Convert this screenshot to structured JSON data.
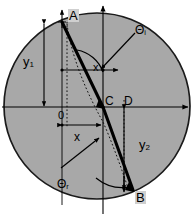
{
  "figure": {
    "type": "optics-ray-diagram",
    "background_color": "#ffffff",
    "disk_fill_color": "#a8a8a8",
    "disk_stroke_color": "#1a1a1a",
    "line_color": "#000000",
    "width": 194,
    "height": 216
  },
  "points": {
    "A": {
      "label": "A",
      "x": 62,
      "y": 22,
      "note": "entry point, top of ray"
    },
    "B": {
      "label": "B",
      "x": 133,
      "y": 190,
      "note": "exit point, bottom of ray"
    },
    "C": {
      "label": "C",
      "x": 103,
      "y": 107,
      "note": "center of circle / origin of axes"
    },
    "D": {
      "label": "D",
      "x": 124,
      "y": 107,
      "note": "point on horizontal axis right of C"
    },
    "O": {
      "label": "0",
      "x": 62,
      "y": 117,
      "note": "origin tick on left vertical"
    }
  },
  "angles": {
    "incident": {
      "label": "Θ",
      "subscript": "i",
      "full": "Θi"
    },
    "refracted": {
      "label": "Θ",
      "subscript": "r",
      "full": "Θr"
    }
  },
  "measures": {
    "y1": {
      "label": "y",
      "subscript": "1",
      "full": "y1",
      "orientation": "vertical",
      "from_y": 22,
      "to_y": 108,
      "at_x": 44
    },
    "y2": {
      "label": "y",
      "subscript": "2",
      "full": "y2",
      "orientation": "vertical",
      "from_y": 107,
      "to_y": 192,
      "at_x": 124
    },
    "x": {
      "label": "x",
      "subscript": "",
      "full": "x",
      "orientation": "horizontal",
      "from_x": 62,
      "to_x": 103,
      "at_y": 125
    },
    "x_center": {
      "label": "x",
      "subscript": "",
      "full": "x",
      "orientation": "point",
      "at_x": 95,
      "at_y": 65
    }
  },
  "axes": {
    "horizontal": {
      "from_x": 2,
      "to_x": 191,
      "y": 107,
      "arrow": "right"
    },
    "vertical": {
      "x": 103,
      "from_y": 4,
      "to_y": 214,
      "arrow": "up"
    },
    "secondary_horizontal": {
      "from_x": 62,
      "to_x": 122,
      "y": 70,
      "arrow": "right"
    }
  }
}
